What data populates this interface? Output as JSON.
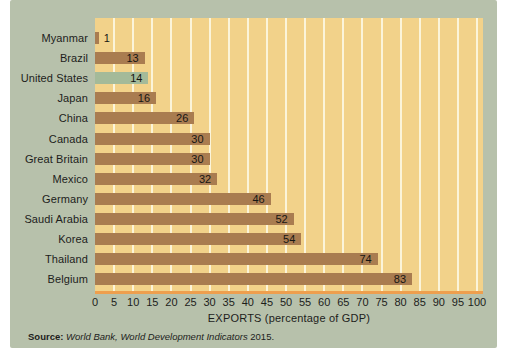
{
  "chart_data": {
    "type": "bar",
    "orientation": "horizontal",
    "categories": [
      "Myanmar",
      "Brazil",
      "United States",
      "Japan",
      "China",
      "Canada",
      "Great Britain",
      "Mexico",
      "Germany",
      "Saudi Arabia",
      "Korea",
      "Thailand",
      "Belgium"
    ],
    "values": [
      1,
      13,
      14,
      16,
      26,
      30,
      30,
      32,
      46,
      52,
      54,
      74,
      83
    ],
    "highlight_category": "United States",
    "title": "",
    "xlabel": "EXPORTS (percentage of GDP)",
    "ylabel": "",
    "xlim": [
      0,
      100
    ],
    "xticks": [
      0,
      5,
      10,
      15,
      20,
      25,
      30,
      35,
      40,
      45,
      50,
      55,
      60,
      65,
      70,
      75,
      80,
      85,
      90,
      95,
      100
    ],
    "grid": "vertical gridlines every 5 units, drawn behind bars",
    "legend": "none",
    "value_labels": "at right end of each bar",
    "source_prefix": "Source:",
    "source_italic": "World Bank, World Development Indicators",
    "source_year": "2015.",
    "colors": {
      "bar": "#a97c50",
      "highlight_bar": "#a4ba99",
      "plot_bg": "#f2d28a",
      "card_bg": "#b7c1ab",
      "gridline": "#fbf4da",
      "axis_line": "#ee9f4e",
      "text": "#1d1d1b"
    }
  }
}
